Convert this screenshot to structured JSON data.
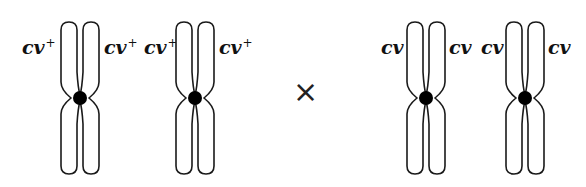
{
  "diagram": {
    "type": "genetic-cross",
    "operator": "×",
    "parents": [
      {
        "name": "wild-type parent",
        "chromosomes": [
          {
            "left_label": "cv",
            "left_sup": "+",
            "right_label": "cv",
            "right_sup": "+"
          },
          {
            "left_label": "cv",
            "left_sup": "+",
            "right_label": "cv",
            "right_sup": "+"
          }
        ]
      },
      {
        "name": "mutant parent",
        "chromosomes": [
          {
            "left_label": "cv",
            "left_sup": "",
            "right_label": "cv",
            "right_sup": ""
          },
          {
            "left_label": "cv",
            "left_sup": "",
            "right_label": "cv",
            "right_sup": ""
          }
        ]
      }
    ]
  },
  "colors": {
    "outline": "#1a1a1a",
    "centromere": "#000000",
    "background": "#ffffff"
  }
}
